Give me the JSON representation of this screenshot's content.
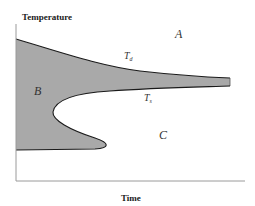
{
  "axes": {
    "y_label": "Temperature",
    "x_label": "Time"
  },
  "regions": {
    "A": "A",
    "B": "B",
    "C": "C"
  },
  "curves": {
    "upper": {
      "symbol": "T",
      "subscript": "d"
    },
    "lower": {
      "symbol": "T",
      "subscript": "s"
    }
  },
  "colors": {
    "fill": "#a9a9a9",
    "stroke": "#1a1a1a",
    "axis": "#9a9a9a"
  }
}
